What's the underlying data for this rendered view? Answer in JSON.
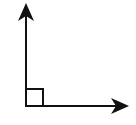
{
  "diagram": {
    "type": "right-angle",
    "stroke_color": "#111111",
    "background": "#ffffff",
    "vertex": {
      "x": 26,
      "y": 106
    },
    "vertical_ray": {
      "x1": 26,
      "y1": 106,
      "x2": 26,
      "y2": 4,
      "direction": "up"
    },
    "horizontal_ray": {
      "x1": 26,
      "y1": 106,
      "x2": 128,
      "y2": 106,
      "direction": "right"
    },
    "right_angle_marker": {
      "x": 26,
      "y": 89,
      "size": 17
    }
  }
}
